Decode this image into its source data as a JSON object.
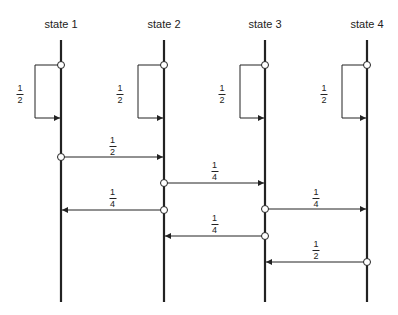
{
  "states": [
    {
      "label": "state 1",
      "x": 61
    },
    {
      "label": "state 2",
      "x": 164
    },
    {
      "label": "state 3",
      "x": 265
    },
    {
      "label": "state 4",
      "x": 367
    }
  ],
  "self_loops": [
    {
      "state": 0,
      "prob_num": "1",
      "prob_den": "2",
      "label_x": 20,
      "label_y": 84,
      "loop_left": 35
    },
    {
      "state": 1,
      "prob_num": "1",
      "prob_den": "2",
      "label_x": 120,
      "label_y": 84,
      "loop_left": 138
    },
    {
      "state": 2,
      "prob_num": "1",
      "prob_den": "2",
      "label_x": 222,
      "label_y": 84,
      "loop_left": 240
    },
    {
      "state": 3,
      "prob_num": "1",
      "prob_den": "2",
      "label_x": 324,
      "label_y": 84,
      "loop_left": 342
    }
  ],
  "transitions": [
    {
      "from": 0,
      "to": 1,
      "y": 157,
      "prob_num": "1",
      "prob_den": "2",
      "label_y": 136
    },
    {
      "from": 1,
      "to": 2,
      "y": 183,
      "prob_num": "1",
      "prob_den": "4",
      "label_y": 161
    },
    {
      "from": 1,
      "to": 0,
      "y": 210,
      "prob_num": "1",
      "prob_den": "4",
      "label_y": 188
    },
    {
      "from": 2,
      "to": 3,
      "y": 209,
      "prob_num": "1",
      "prob_den": "4",
      "label_y": 188
    },
    {
      "from": 2,
      "to": 1,
      "y": 236,
      "prob_num": "1",
      "prob_den": "4",
      "label_y": 214
    },
    {
      "from": 3,
      "to": 2,
      "y": 262,
      "prob_num": "1",
      "prob_den": "2",
      "label_y": 240
    }
  ],
  "layout": {
    "line_top": 40,
    "line_bottom": 302,
    "loop_top": 65,
    "loop_bottom": 118,
    "label_y": 18
  },
  "colors": {
    "line": "#222222"
  }
}
